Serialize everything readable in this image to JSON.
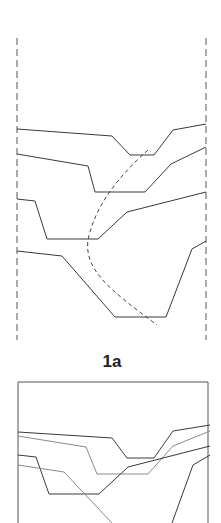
{
  "figure": {
    "label": "1a",
    "colors": {
      "line": "#3a3a3a",
      "faint": "#8a8a8a",
      "background": "#ffffff"
    }
  },
  "panel_top": {
    "boundaries": {
      "left_x": 17,
      "right_x": 206,
      "top_y": 38,
      "bottom_y": 340,
      "style": "dashed"
    },
    "profiles": [
      {
        "name": "profile-1",
        "points": [
          [
            17,
            129
          ],
          [
            112,
            136
          ],
          [
            130,
            155
          ],
          [
            154,
            155
          ],
          [
            173,
            130
          ],
          [
            206,
            124
          ]
        ]
      },
      {
        "name": "profile-2",
        "points": [
          [
            17,
            154
          ],
          [
            88,
            166
          ],
          [
            95,
            192
          ],
          [
            145,
            192
          ],
          [
            171,
            164
          ],
          [
            206,
            147
          ]
        ]
      },
      {
        "name": "profile-3",
        "points": [
          [
            17,
            199
          ],
          [
            35,
            201
          ],
          [
            47,
            239
          ],
          [
            98,
            239
          ],
          [
            127,
            212
          ],
          [
            206,
            192
          ]
        ]
      },
      {
        "name": "profile-4",
        "points": [
          [
            17,
            251
          ],
          [
            62,
            256
          ],
          [
            115,
            317
          ],
          [
            166,
            317
          ],
          [
            192,
            249
          ],
          [
            206,
            241
          ]
        ]
      }
    ],
    "dashed_curve": {
      "name": "axis-curve",
      "path": "M148,150 C120,175 95,205 88,240 C84,270 110,290 157,325"
    }
  },
  "panel_bottom": {
    "box": {
      "left_x": 18,
      "right_x": 208,
      "top_y": 382
    },
    "profiles": [
      {
        "name": "profile-1",
        "points": [
          [
            18,
            432
          ],
          [
            112,
            438
          ],
          [
            127,
            458
          ],
          [
            154,
            458
          ],
          [
            173,
            431
          ],
          [
            210,
            425
          ]
        ]
      },
      {
        "name": "profile-2",
        "points": [
          [
            18,
            436
          ],
          [
            86,
            447
          ],
          [
            97,
            474
          ],
          [
            148,
            474
          ],
          [
            173,
            446
          ],
          [
            210,
            431
          ]
        ]
      },
      {
        "name": "profile-3",
        "points": [
          [
            18,
            455
          ],
          [
            36,
            457
          ],
          [
            49,
            494
          ],
          [
            99,
            494
          ],
          [
            128,
            467
          ],
          [
            210,
            446
          ]
        ]
      },
      {
        "name": "profile-4a",
        "points": [
          [
            18,
            465
          ],
          [
            64,
            472
          ],
          [
            112,
            523
          ]
        ]
      },
      {
        "name": "profile-4b",
        "points": [
          [
            172,
            523
          ],
          [
            193,
            465
          ],
          [
            210,
            455
          ]
        ]
      }
    ]
  }
}
